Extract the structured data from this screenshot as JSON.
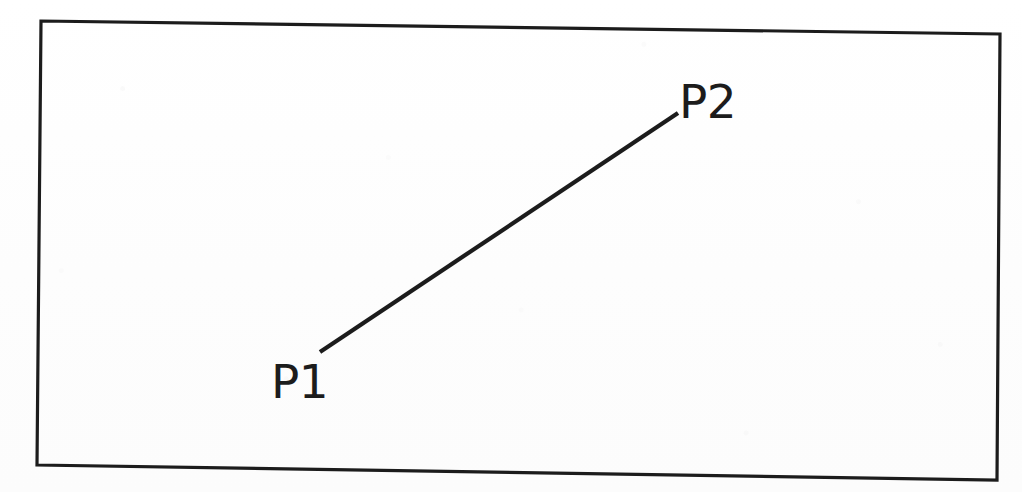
{
  "figure": {
    "type": "technical-line-drawing",
    "background_color": "#fefefe",
    "ink_color": "#1c1c1c"
  },
  "frame": {
    "name": "drawing-border",
    "shape": "quadrilateral",
    "stroke_width_px": 3,
    "stroke_color": "#1c1c1c",
    "corners": {
      "top_left": [
        41,
        21
      ],
      "top_right": [
        1000,
        34
      ],
      "bottom_right": [
        997,
        480
      ],
      "bottom_left": [
        37,
        465
      ]
    }
  },
  "segment": {
    "name": "line-segment-p1-p2",
    "stroke_width_px": 4,
    "stroke_color": "#1c1c1c",
    "start": [
      320,
      352
    ],
    "end": [
      678,
      113
    ]
  },
  "labels": [
    {
      "id": "p1",
      "text": "P1",
      "x": 271,
      "y": 358,
      "font_size_px": 47,
      "anchors_point": [
        320,
        352
      ]
    },
    {
      "id": "p2",
      "text": "P2",
      "x": 679,
      "y": 78,
      "font_size_px": 47,
      "anchors_point": [
        678,
        113
      ]
    }
  ],
  "chart_data": {
    "type": "line",
    "title": "",
    "xlabel": "",
    "ylabel": "",
    "grid": false,
    "legend": "none",
    "annotations": [
      "P1",
      "P2"
    ],
    "series": [
      {
        "name": "segment",
        "points": [
          {
            "label": "P1",
            "x": 320,
            "y": 352
          },
          {
            "label": "P2",
            "x": 678,
            "y": 113
          }
        ]
      }
    ]
  }
}
